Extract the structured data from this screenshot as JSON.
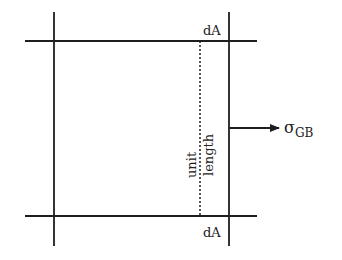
{
  "diagram": {
    "labels": {
      "top_area": "dA",
      "bottom_area": "dA",
      "unit": "unit",
      "length": "length",
      "stress_symbol": "σ",
      "stress_subscript": "GB"
    },
    "colors": {
      "line": "#1e1e1e",
      "text": "#222222",
      "background": "#ffffff"
    },
    "geometry": {
      "left_vertical_x": 54,
      "right_vertical_x": 229,
      "top_horizontal_y": 41,
      "bottom_horizontal_y": 216,
      "dotted_line_x": 200,
      "arrow_y": 128
    }
  }
}
